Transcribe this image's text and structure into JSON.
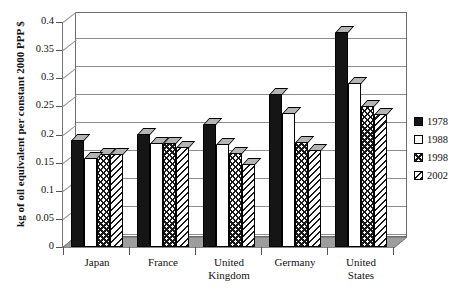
{
  "chart_data": {
    "type": "bar",
    "title": "",
    "xlabel": "",
    "ylabel": "kg of oil equivalent per constant 2000 PPP $",
    "ylim": [
      0,
      0.4
    ],
    "yticks": [
      "0",
      "0.05",
      "0.1",
      "0.15",
      "0.2",
      "0.25",
      "0.3",
      "0.35",
      "0.4"
    ],
    "grid": true,
    "legend_position": "right",
    "categories": [
      "Japan",
      "France",
      "United Kingdom",
      "Germany",
      "United States"
    ],
    "category_lines": [
      [
        "Japan"
      ],
      [
        "France"
      ],
      [
        "United",
        "Kingdom"
      ],
      [
        "Germany"
      ],
      [
        "United",
        "States"
      ]
    ],
    "series": [
      {
        "name": "1978",
        "fill": "solid-black",
        "values": [
          0.19,
          0.201,
          0.218,
          0.272,
          0.382
        ]
      },
      {
        "name": "1988",
        "fill": "white",
        "values": [
          0.158,
          0.185,
          0.183,
          0.238,
          0.292
        ]
      },
      {
        "name": "1998",
        "fill": "crosshatch",
        "values": [
          0.165,
          0.185,
          0.167,
          0.187,
          0.25
        ]
      },
      {
        "name": "2002",
        "fill": "diagonal-hatch",
        "values": [
          0.165,
          0.177,
          0.148,
          0.172,
          0.237
        ]
      }
    ]
  },
  "legend": {
    "items": [
      {
        "label": "1978",
        "swatch": "solid-black"
      },
      {
        "label": "1988",
        "swatch": "white"
      },
      {
        "label": "1998",
        "swatch": "crosshatch"
      },
      {
        "label": "2002",
        "swatch": "diagonal-hatch"
      }
    ]
  },
  "colors": {
    "series_1978": "#151515",
    "series_1988": "#ffffff",
    "hatch": "#1a1a1a",
    "floor": "#9d9d9d",
    "gridline": "#8d8d8d",
    "axis": "#6b6b6b"
  }
}
